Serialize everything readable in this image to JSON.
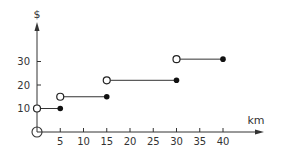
{
  "chart_data": {
    "type": "line",
    "subtype": "step",
    "title": "",
    "xlabel": "km",
    "ylabel": "$",
    "xlim": [
      0,
      45
    ],
    "ylim": [
      0,
      40
    ],
    "x_ticks": [
      5,
      10,
      15,
      20,
      25,
      30,
      35,
      40
    ],
    "y_ticks": [
      10,
      20,
      30
    ],
    "x_tick_labels": [
      "5",
      "10",
      "15",
      "20",
      "25",
      "30",
      "35",
      "40"
    ],
    "y_tick_labels": [
      "10",
      "20",
      "30"
    ],
    "grid": false,
    "legend": null,
    "segments": [
      {
        "x_start": 0,
        "x_end": 5,
        "y": 10,
        "start_open": true,
        "end_closed": true
      },
      {
        "x_start": 5,
        "x_end": 15,
        "y": 15,
        "start_open": true,
        "end_closed": true
      },
      {
        "x_start": 15,
        "x_end": 30,
        "y": 22,
        "start_open": true,
        "end_closed": true
      },
      {
        "x_start": 30,
        "x_end": 40,
        "y": 31,
        "start_open": true,
        "end_closed": true
      }
    ],
    "extra_points": [
      {
        "x": 0,
        "y": 0,
        "style": "open-circle-large"
      }
    ]
  }
}
